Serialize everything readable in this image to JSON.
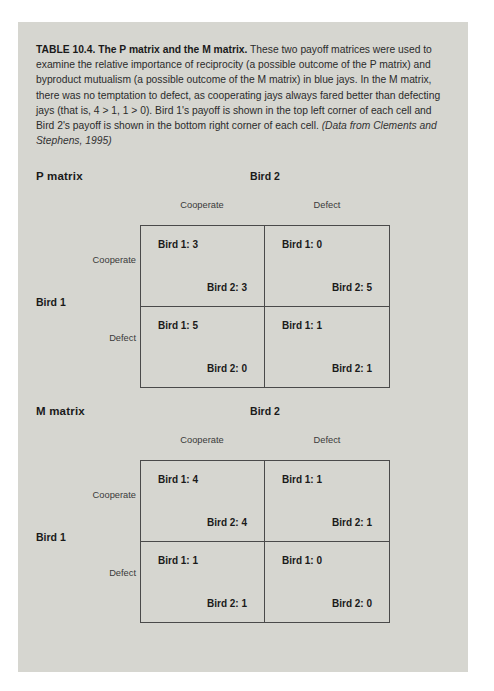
{
  "caption": {
    "lead": "TABLE 10.4.  The P matrix and the M matrix.",
    "body": "  These two payoff matrices were used to examine the relative importance of reciprocity (a possible outcome of the P matrix) and byproduct mutualism (a possible outcome of the M matrix) in blue jays. In the M matrix, there was no temptation to defect, as cooperating jays always fared better than defecting jays (that is, 4 > 1, 1 > 0). Bird 1's payoff is shown in the top left corner of each cell and Bird 2's payoff is shown in the bottom right corner of each cell. ",
    "source": "(Data from Clements and Stephens, 1995)"
  },
  "labels": {
    "row_player": "Bird 1",
    "col_player": "Bird 2",
    "cooperate": "Cooperate",
    "defect": "Defect",
    "row1_prefix": "Bird 1:",
    "row2_prefix": "Bird 2:"
  },
  "chart_data": {
    "type": "table",
    "title": "The P matrix and the M matrix",
    "row_player": "Bird 1",
    "col_player": "Bird 2",
    "strategies": [
      "Cooperate",
      "Defect"
    ],
    "matrices": [
      {
        "name": "P matrix",
        "cells": [
          {
            "row": "Cooperate",
            "col": "Cooperate",
            "bird1": "Bird 1: 3",
            "bird2": "Bird 2: 3",
            "bird1_value": 3,
            "bird2_value": 3
          },
          {
            "row": "Cooperate",
            "col": "Defect",
            "bird1": "Bird 1: 0",
            "bird2": "Bird 2: 5",
            "bird1_value": 0,
            "bird2_value": 5
          },
          {
            "row": "Defect",
            "col": "Cooperate",
            "bird1": "Bird 1: 5",
            "bird2": "Bird 2: 0",
            "bird1_value": 5,
            "bird2_value": 0
          },
          {
            "row": "Defect",
            "col": "Defect",
            "bird1": "Bird 1: 1",
            "bird2": "Bird 2: 1",
            "bird1_value": 1,
            "bird2_value": 1
          }
        ]
      },
      {
        "name": "M matrix",
        "cells": [
          {
            "row": "Cooperate",
            "col": "Cooperate",
            "bird1": "Bird 1: 4",
            "bird2": "Bird 2: 4",
            "bird1_value": 4,
            "bird2_value": 4
          },
          {
            "row": "Cooperate",
            "col": "Defect",
            "bird1": "Bird 1: 1",
            "bird2": "Bird 2: 1",
            "bird1_value": 1,
            "bird2_value": 1
          },
          {
            "row": "Defect",
            "col": "Cooperate",
            "bird1": "Bird 1: 1",
            "bird2": "Bird 2: 1",
            "bird1_value": 1,
            "bird2_value": 1
          },
          {
            "row": "Defect",
            "col": "Defect",
            "bird1": "Bird 1: 0",
            "bird2": "Bird 2: 0",
            "bird1_value": 0,
            "bird2_value": 0
          }
        ]
      }
    ]
  },
  "colors": {
    "page_bg": "#d6d6d0",
    "border": "#4a4a4a",
    "text": "#1a1a1a"
  }
}
